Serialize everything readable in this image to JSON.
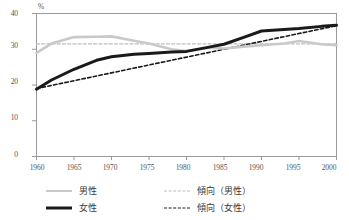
{
  "chart_data": {
    "type": "line",
    "title": "",
    "subtitle": "",
    "xlabel": "",
    "ylabel": "",
    "unit_label": "%",
    "x": [
      1960,
      1965,
      1970,
      1975,
      1980,
      1985,
      1990,
      1995,
      2000
    ],
    "xlim": [
      1960,
      2000
    ],
    "ylim": [
      0,
      40
    ],
    "yticks": [
      0,
      10,
      20,
      30,
      40
    ],
    "xticks": [
      1960,
      1965,
      1970,
      1975,
      1980,
      1985,
      1990,
      1995,
      2000
    ],
    "grid": false,
    "legend_position": "bottom",
    "series": [
      {
        "name": "男性",
        "style": "solid",
        "color": "#c9c9c9",
        "x": [
          1960,
          1962,
          1965,
          1968,
          1970,
          1973,
          1975,
          1978,
          1980,
          1983,
          1985,
          1988,
          1990,
          1993,
          1995,
          1998,
          2000
        ],
        "values": [
          29.0,
          31.6,
          33.4,
          33.5,
          33.6,
          32.4,
          31.6,
          30.0,
          29.5,
          30.4,
          30.2,
          30.8,
          31.1,
          31.6,
          32.3,
          31.4,
          31.1
        ]
      },
      {
        "name": "女性",
        "style": "solid",
        "color": "#1a1a1a",
        "x": [
          1960,
          1962,
          1965,
          1968,
          1970,
          1973,
          1975,
          1978,
          1980,
          1983,
          1985,
          1988,
          1990,
          1993,
          1995,
          1998,
          2000
        ],
        "values": [
          18.8,
          21.4,
          24.4,
          26.9,
          27.9,
          28.6,
          28.8,
          29.2,
          29.4,
          30.6,
          31.4,
          33.6,
          35.1,
          35.5,
          35.8,
          36.4,
          36.7
        ]
      },
      {
        "name": "傾向（男性）",
        "style": "dashed",
        "color": "#bdbdbd",
        "x": [
          1960,
          2000
        ],
        "values": [
          31.5,
          31.5
        ]
      },
      {
        "name": "傾向（女性）",
        "style": "dashed",
        "color": "#1a1a1a",
        "x": [
          1960,
          2000
        ],
        "values": [
          19.0,
          36.6
        ]
      }
    ],
    "legend": [
      {
        "label": "男性",
        "style": "solid",
        "color": "#c9c9c9"
      },
      {
        "label": "傾向（男性）",
        "style": "dashed",
        "color": "#bdbdbd"
      },
      {
        "label": "女性",
        "style": "solid",
        "color": "#1a1a1a"
      },
      {
        "label": "傾向（女性）",
        "style": "dashed",
        "color": "#1a1a1a"
      }
    ]
  },
  "axis": {
    "unit": "%",
    "y_labels": [
      "40",
      "30",
      "20",
      "10",
      "0"
    ],
    "x_labels": [
      "1960",
      "1965",
      "1970",
      "1975",
      "1980",
      "1985",
      "1990",
      "1995",
      "2000"
    ]
  },
  "legend_rows": [
    {
      "left_label": "男性",
      "right_label": "傾向（男性）"
    },
    {
      "left_label": "女性",
      "right_label": "傾向（女性）"
    }
  ],
  "colors": {
    "male": "#c9c9c9",
    "female": "#1a1a1a",
    "male_trend": "#bdbdbd",
    "female_trend": "#1a1a1a",
    "axis": "#9a9a9a",
    "text": "#555555"
  }
}
